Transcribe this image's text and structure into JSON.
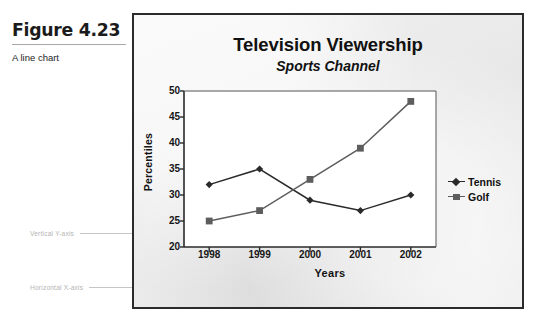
{
  "figure": {
    "number": "Figure 4.23",
    "caption": "A line chart"
  },
  "annotations": {
    "y_axis_callout": "Vertical Y-axis",
    "x_axis_callout": "Horizontal X-axis"
  },
  "colors": {
    "figure_background": "#ededed",
    "figure_border": "#2b2b2b",
    "plot_background": "#ffffff",
    "tennis_series": "#2a2a2a",
    "golf_series": "#5d5d5d",
    "text": "#111111",
    "callout_text": "#b4b4b4"
  },
  "chart_data": {
    "type": "line",
    "title": "Television Viewership",
    "subtitle": "Sports Channel",
    "xlabel": "Years",
    "ylabel": "Percentiles",
    "categories": [
      "1998",
      "1999",
      "2000",
      "2001",
      "2002"
    ],
    "ylim": [
      20,
      50
    ],
    "yticks": [
      20,
      25,
      30,
      35,
      40,
      45,
      50
    ],
    "grid": false,
    "legend_position": "right",
    "series": [
      {
        "name": "Tennis",
        "marker": "diamond",
        "color": "#2a2a2a",
        "values": [
          32,
          35,
          29,
          27,
          30
        ]
      },
      {
        "name": "Golf",
        "marker": "square",
        "color": "#5d5d5d",
        "values": [
          25,
          27,
          33,
          39,
          48
        ]
      }
    ]
  }
}
